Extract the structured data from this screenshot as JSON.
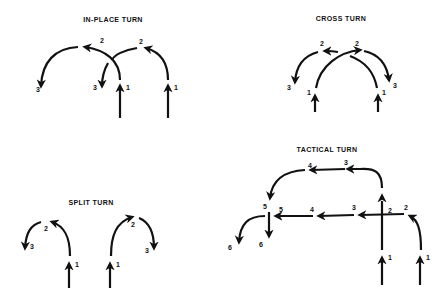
{
  "figure": {
    "background": "#ffffff",
    "ink_color": "#111111",
    "panels": [
      {
        "id": "in-place-turn",
        "title": "IN-PLACE TURN",
        "point_labels": [
          "2",
          "3",
          "1",
          "2",
          "3",
          "1"
        ]
      },
      {
        "id": "cross-turn",
        "title": "CROSS TURN",
        "point_labels": [
          "2",
          "3",
          "1",
          "2",
          "3",
          "1"
        ]
      },
      {
        "id": "split-turn",
        "title": "SPLIT TURN",
        "point_labels": [
          "2",
          "3",
          "1",
          "2",
          "3",
          "1"
        ]
      },
      {
        "id": "tactical-turn",
        "title": "TACTICAL TURN",
        "point_labels": [
          "4",
          "3",
          "5",
          "2",
          "5",
          "4",
          "3",
          "2",
          "6",
          "6",
          "1",
          "1"
        ]
      }
    ]
  }
}
